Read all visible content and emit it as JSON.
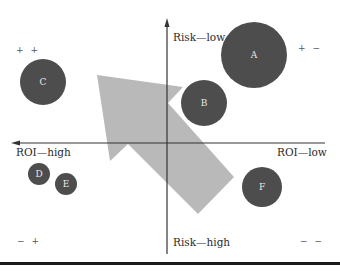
{
  "diagram": {
    "type": "quadrant-bubble-chart",
    "axes": {
      "vertical_top": "Risk—low",
      "vertical_bottom": "Risk—high",
      "horizontal_left": "ROI—high",
      "horizontal_right": "ROI—low"
    },
    "quadrants": {
      "top_left": "+ +",
      "top_right": "+ −",
      "bottom_left": "− +",
      "bottom_right": "− −"
    },
    "bubbles": [
      {
        "label": "A",
        "cx": 254,
        "cy": 55,
        "r": 33,
        "quadrant": "top_right"
      },
      {
        "label": "B",
        "cx": 204,
        "cy": 103,
        "r": 23,
        "quadrant": "top_right"
      },
      {
        "label": "C",
        "cx": 43,
        "cy": 82,
        "r": 23,
        "quadrant": "top_left"
      },
      {
        "label": "D",
        "cx": 39,
        "cy": 174,
        "r": 11,
        "quadrant": "bottom_left"
      },
      {
        "label": "E",
        "cx": 66,
        "cy": 184,
        "r": 11,
        "quadrant": "bottom_left"
      },
      {
        "label": "F",
        "cx": 262,
        "cy": 187,
        "r": 20,
        "quadrant": "bottom_right"
      }
    ],
    "big_arrow": {
      "direction": "toward top-left (high ROI, low risk)",
      "color": "#b9b9b9"
    },
    "colors": {
      "bubble_fill": "#4d4d4d",
      "bubble_text": "#e8e8e8",
      "axis": "#333333",
      "arrow": "#b9b9b9"
    }
  }
}
